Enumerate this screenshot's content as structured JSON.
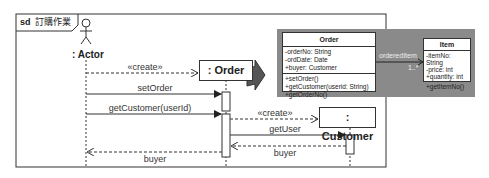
{
  "frame": {
    "keyword": "sd",
    "name": "訂購作業"
  },
  "lifelines": {
    "actor": ": Actor",
    "order": ": Order",
    "customer": ": Customer"
  },
  "messages": [
    {
      "label": "«create»",
      "from": "actor",
      "to": "order",
      "type": "create"
    },
    {
      "label": "setOrder",
      "from": "actor",
      "to": "order",
      "type": "sync"
    },
    {
      "label": "getCustomer(userId)",
      "from": "actor",
      "to": "order",
      "type": "sync"
    },
    {
      "label": "«create»",
      "from": "order",
      "to": "customer",
      "type": "create"
    },
    {
      "label": "getUser",
      "from": "order",
      "to": "customer",
      "type": "sync"
    },
    {
      "label": "buyer",
      "from": "customer",
      "to": "order",
      "type": "return"
    },
    {
      "label": "buyer",
      "from": "order",
      "to": "actor",
      "type": "return"
    }
  ],
  "class_diagram": {
    "order_class": {
      "name": "Order",
      "attributes": [
        "-orderNo: String",
        "-ordDate: Date",
        "+buyer: Customer"
      ],
      "operations": [
        "+setOrder()",
        "+getCustomer(userid: String)",
        "+getOrderNo()"
      ]
    },
    "item_class": {
      "name": "Item",
      "attributes": [
        "-itemNo: String",
        "-price: int",
        "+quantity: int"
      ],
      "operations": [
        "+getItemNo()"
      ]
    },
    "association": {
      "role": "orderedItem",
      "multiplicity": "1..*"
    }
  },
  "colors": {
    "panel_gray": "#8a8a8a",
    "line": "#333333",
    "arrow_icon": "#555555"
  }
}
